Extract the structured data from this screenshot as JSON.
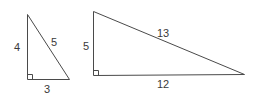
{
  "diagram": {
    "triangles": [
      {
        "name": "small-triangle",
        "legs": {
          "vertical": "4",
          "horizontal": "3"
        },
        "hypotenuse": "5",
        "right_angle_marker": true
      },
      {
        "name": "large-triangle",
        "legs": {
          "vertical": "5",
          "horizontal": "12"
        },
        "hypotenuse": "13",
        "right_angle_marker": true
      }
    ]
  }
}
